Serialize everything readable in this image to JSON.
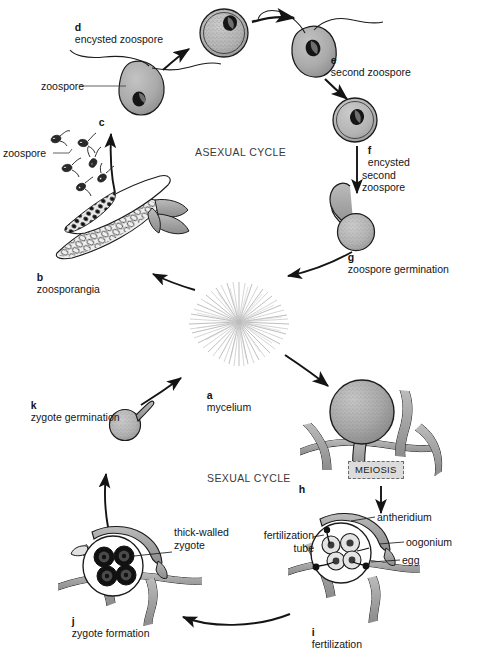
{
  "figure": {
    "cycles": [
      {
        "id": "asexual",
        "label": "ASEXUAL CYCLE"
      },
      {
        "id": "sexual",
        "label": "SEXUAL CYCLE"
      }
    ],
    "process_box": {
      "label": "MEIOSIS"
    },
    "stages": [
      {
        "key": "a",
        "letter": "a",
        "label": "mycelium"
      },
      {
        "key": "b",
        "letter": "b",
        "label": "zoosporangia"
      },
      {
        "key": "c",
        "letter": "c",
        "label": ""
      },
      {
        "key": "d",
        "letter": "d",
        "label": "encysted zoospore"
      },
      {
        "key": "e",
        "letter": "e",
        "label": "second zoospore"
      },
      {
        "key": "f",
        "letter": "f",
        "label": "encysted\nsecond\nzoospore"
      },
      {
        "key": "g",
        "letter": "g",
        "label": "zoospore germination"
      },
      {
        "key": "h",
        "letter": "h",
        "label": ""
      },
      {
        "key": "i",
        "letter": "i",
        "label": "fertilization"
      },
      {
        "key": "j",
        "letter": "j",
        "label": "zygote formation"
      },
      {
        "key": "k",
        "letter": "k",
        "label": "zygote germination"
      }
    ],
    "callouts": [
      {
        "key": "zoospore_swarm",
        "label": "zoospore"
      },
      {
        "key": "zoospore_c",
        "label": "zoospore"
      },
      {
        "key": "thick_walled_zygote",
        "label": "thick-walled\nzygote"
      },
      {
        "key": "antheridium",
        "label": "antheridium"
      },
      {
        "key": "oogonium",
        "label": "oogonium"
      },
      {
        "key": "egg",
        "label": "egg"
      },
      {
        "key": "fertilization_tube",
        "label": "fertilization\ntube"
      }
    ],
    "colors": {
      "background": "#ffffff",
      "ink": "#151515",
      "cell_fill": "#a9a9a9",
      "cell_fill_light": "#bdbdbd",
      "hypha_fill": "#9e9e9e",
      "mycelium": "#b4b4b4",
      "nucleus": "#1b1b1b",
      "meiosis_box_fill": "#dcdcdc",
      "meiosis_box_border": "#6b6b6b"
    }
  }
}
